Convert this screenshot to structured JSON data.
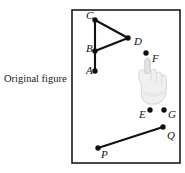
{
  "caption": {
    "text": "Original figure"
  },
  "figure": {
    "frame": {
      "x": 72,
      "y": 10,
      "width": 108,
      "height": 153,
      "stroke": "#1a1a1a",
      "stroke_width": 1.6
    },
    "point_color": "#111111",
    "line_color": "#111111",
    "label_color": "#111111",
    "points": [
      {
        "id": "A",
        "label": "A",
        "cx": 95,
        "cy": 71,
        "lx": 86,
        "ly": 74
      },
      {
        "id": "B",
        "label": "B",
        "cx": 95,
        "cy": 51,
        "lx": 86,
        "ly": 52
      },
      {
        "id": "C",
        "label": "C",
        "cx": 95,
        "cy": 20,
        "lx": 86,
        "ly": 19
      },
      {
        "id": "D",
        "label": "D",
        "cx": 128,
        "cy": 38,
        "lx": 134,
        "ly": 45
      },
      {
        "id": "E",
        "label": "E",
        "cx": 150,
        "cy": 110,
        "lx": 139,
        "ly": 118
      },
      {
        "id": "F",
        "label": "F",
        "cx": 146,
        "cy": 53,
        "lx": 152,
        "ly": 62
      },
      {
        "id": "G",
        "label": "G",
        "cx": 164,
        "cy": 110,
        "lx": 168,
        "ly": 118
      },
      {
        "id": "P",
        "label": "P",
        "cx": 98,
        "cy": 148,
        "lx": 101,
        "ly": 158
      },
      {
        "id": "Q",
        "label": "Q",
        "cx": 163,
        "cy": 127,
        "lx": 167,
        "ly": 139
      }
    ],
    "segments": [
      {
        "id": "C-A",
        "from": "C",
        "to": "A"
      },
      {
        "id": "C-D",
        "from": "C",
        "to": "D"
      },
      {
        "id": "D-B",
        "from": "D",
        "to": "B"
      },
      {
        "id": "P-Q",
        "from": "P",
        "to": "Q"
      }
    ],
    "cursor": {
      "name": "pointing-hand-cursor",
      "x": 136,
      "y": 55,
      "width": 32,
      "height": 52,
      "fill": "#efefef",
      "stroke": "#c9c9c9"
    }
  }
}
